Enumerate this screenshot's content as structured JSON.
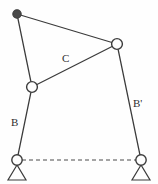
{
  "figure": {
    "background_color": "#fefefe",
    "line_color": "#3b3b3b",
    "canvas": {
      "width": 158,
      "height": 184
    }
  },
  "labels": [
    {
      "id": "coupler",
      "text": "C",
      "x": 62,
      "y": 53
    },
    {
      "id": "crank",
      "text": "B",
      "x": 11,
      "y": 117
    },
    {
      "id": "rocker",
      "text": "B'",
      "x": 133,
      "y": 98
    }
  ],
  "joints": [
    {
      "id": "coupler-point",
      "type": "filled",
      "x": 17,
      "y": 14,
      "r": 4.2
    },
    {
      "id": "upper-right-pivot",
      "type": "open",
      "x": 117,
      "y": 44,
      "r": 5.4
    },
    {
      "id": "upper-left-pivot",
      "type": "open",
      "x": 32,
      "y": 87,
      "r": 5.4
    },
    {
      "id": "ground-pivot-left",
      "type": "open",
      "x": 17,
      "y": 160,
      "r": 5.2
    },
    {
      "id": "ground-pivot-right",
      "type": "open",
      "x": 141,
      "y": 160,
      "r": 5.2
    }
  ],
  "links": [
    {
      "id": "coupler-top-edge",
      "from": "coupler-point",
      "to": "upper-right-pivot",
      "x1": 17,
      "y1": 14,
      "x2": 117,
      "y2": 44
    },
    {
      "id": "coupler-left-edge",
      "from": "coupler-point",
      "to": "upper-left-pivot",
      "x1": 17,
      "y1": 14,
      "x2": 32,
      "y2": 87
    },
    {
      "id": "coupler-diagonal-C",
      "from": "upper-left-pivot",
      "to": "upper-right-pivot",
      "x1": 32,
      "y1": 87,
      "x2": 117,
      "y2": 44
    },
    {
      "id": "link-B",
      "from": "upper-left-pivot",
      "to": "ground-pivot-left",
      "x1": 32,
      "y1": 87,
      "x2": 17,
      "y2": 160
    },
    {
      "id": "link-B-prime",
      "from": "upper-right-pivot",
      "to": "ground-pivot-right",
      "x1": 117,
      "y1": 44,
      "x2": 141,
      "y2": 160
    }
  ],
  "ground_line": {
    "id": "ground-reference",
    "style": "dashed",
    "x1": 22,
    "y1": 160,
    "x2": 136,
    "y2": 160
  },
  "supports": [
    {
      "id": "support-left",
      "apex_x": 17,
      "apex_y": 165,
      "half_width": 9,
      "base_y": 180
    },
    {
      "id": "support-right",
      "apex_x": 141,
      "apex_y": 165,
      "half_width": 9,
      "base_y": 180
    }
  ]
}
